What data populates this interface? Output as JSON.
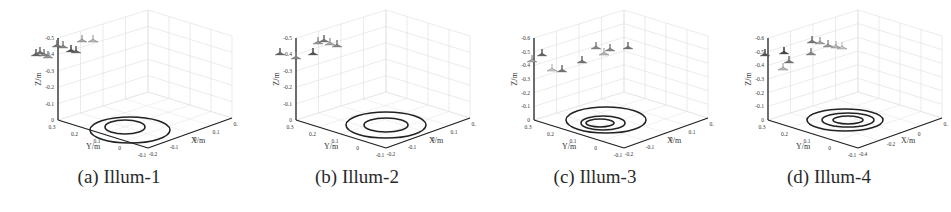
{
  "figure": {
    "panels": [
      {
        "id": "a",
        "caption": "(a) Illum-1",
        "z_ticks": [
          "-0.5",
          "-0.4",
          "-0.3",
          "-0.2",
          "-0.1",
          "0"
        ],
        "y_ticks": [
          "0.3",
          "0.2",
          "0.1",
          "0",
          "-0.1"
        ],
        "x_ticks": [
          "-0.2",
          "-0.1",
          "0",
          "0.1",
          "0.2"
        ],
        "xlabel": "X/m",
        "ylabel": "Y/m",
        "zlabel": "Z/m"
      },
      {
        "id": "b",
        "caption": "(b) Illum-2",
        "z_ticks": [
          "-0.5",
          "-0.4",
          "-0.3",
          "-0.2",
          "-0.1",
          "0"
        ],
        "y_ticks": [
          "0.3",
          "0.2",
          "0.1",
          "0",
          "-0.1"
        ],
        "x_ticks": [
          "-0.2",
          "-0.1",
          "0",
          "0.1",
          "0.2"
        ],
        "xlabel": "X/m",
        "ylabel": "Y/m",
        "zlabel": "Z/m"
      },
      {
        "id": "c",
        "caption": "(c) Illum-3",
        "z_ticks": [
          "-0.6",
          "-0.5",
          "-0.4",
          "-0.3",
          "-0.2",
          "-0.1",
          "0"
        ],
        "y_ticks": [
          "0.3",
          "0.2",
          "0.1",
          "0",
          "-0.1"
        ],
        "x_ticks": [
          "-0.2",
          "-0.1",
          "0",
          "0.1",
          "0.2"
        ],
        "xlabel": "X/m",
        "ylabel": "Y/m",
        "zlabel": "Z/m"
      },
      {
        "id": "d",
        "caption": "(d) Illum-4",
        "z_ticks": [
          "-0.6",
          "-0.5",
          "-0.4",
          "-0.3",
          "-0.2",
          "-0.1",
          "0"
        ],
        "y_ticks": [
          "0.3",
          "0.2",
          "0.1",
          "0",
          "-0.1"
        ],
        "x_ticks": [
          "-0.4",
          "-0.2",
          "0",
          "0.2"
        ],
        "xlabel": "X/m",
        "ylabel": "Y/m",
        "zlabel": "Z/m"
      }
    ]
  },
  "chart_data": [
    {
      "type": "scatter",
      "title": "(a) Illum-1",
      "xlabel": "X/m",
      "ylabel": "Y/m",
      "zlabel": "Z/m",
      "zlim": [
        -0.5,
        0
      ],
      "ylim": [
        -0.1,
        0.3
      ],
      "xlim": [
        -0.2,
        0.2
      ],
      "grid": true,
      "points_label": "light source positions",
      "trajectory": "two concentric ellipses at Z=0"
    },
    {
      "type": "scatter",
      "title": "(b) Illum-2",
      "xlabel": "X/m",
      "ylabel": "Y/m",
      "zlabel": "Z/m",
      "zlim": [
        -0.5,
        0
      ],
      "ylim": [
        -0.1,
        0.3
      ],
      "xlim": [
        -0.2,
        0.2
      ],
      "grid": true,
      "points_label": "light source positions",
      "trajectory": "two concentric ellipses at Z=0"
    },
    {
      "type": "scatter",
      "title": "(c) Illum-3",
      "xlabel": "X/m",
      "ylabel": "Y/m",
      "zlabel": "Z/m",
      "zlim": [
        -0.6,
        0
      ],
      "ylim": [
        -0.1,
        0.3
      ],
      "xlim": [
        -0.2,
        0.2
      ],
      "grid": true,
      "points_label": "light source positions",
      "trajectory": "three concentric ellipses at Z=0"
    },
    {
      "type": "scatter",
      "title": "(d) Illum-4",
      "xlabel": "X/m",
      "ylabel": "Y/m",
      "zlabel": "Z/m",
      "zlim": [
        -0.6,
        0
      ],
      "ylim": [
        -0.1,
        0.3
      ],
      "xlim": [
        -0.4,
        0.2
      ],
      "grid": true,
      "points_label": "light source positions",
      "trajectory": "three concentric ellipses at Z=0"
    }
  ]
}
